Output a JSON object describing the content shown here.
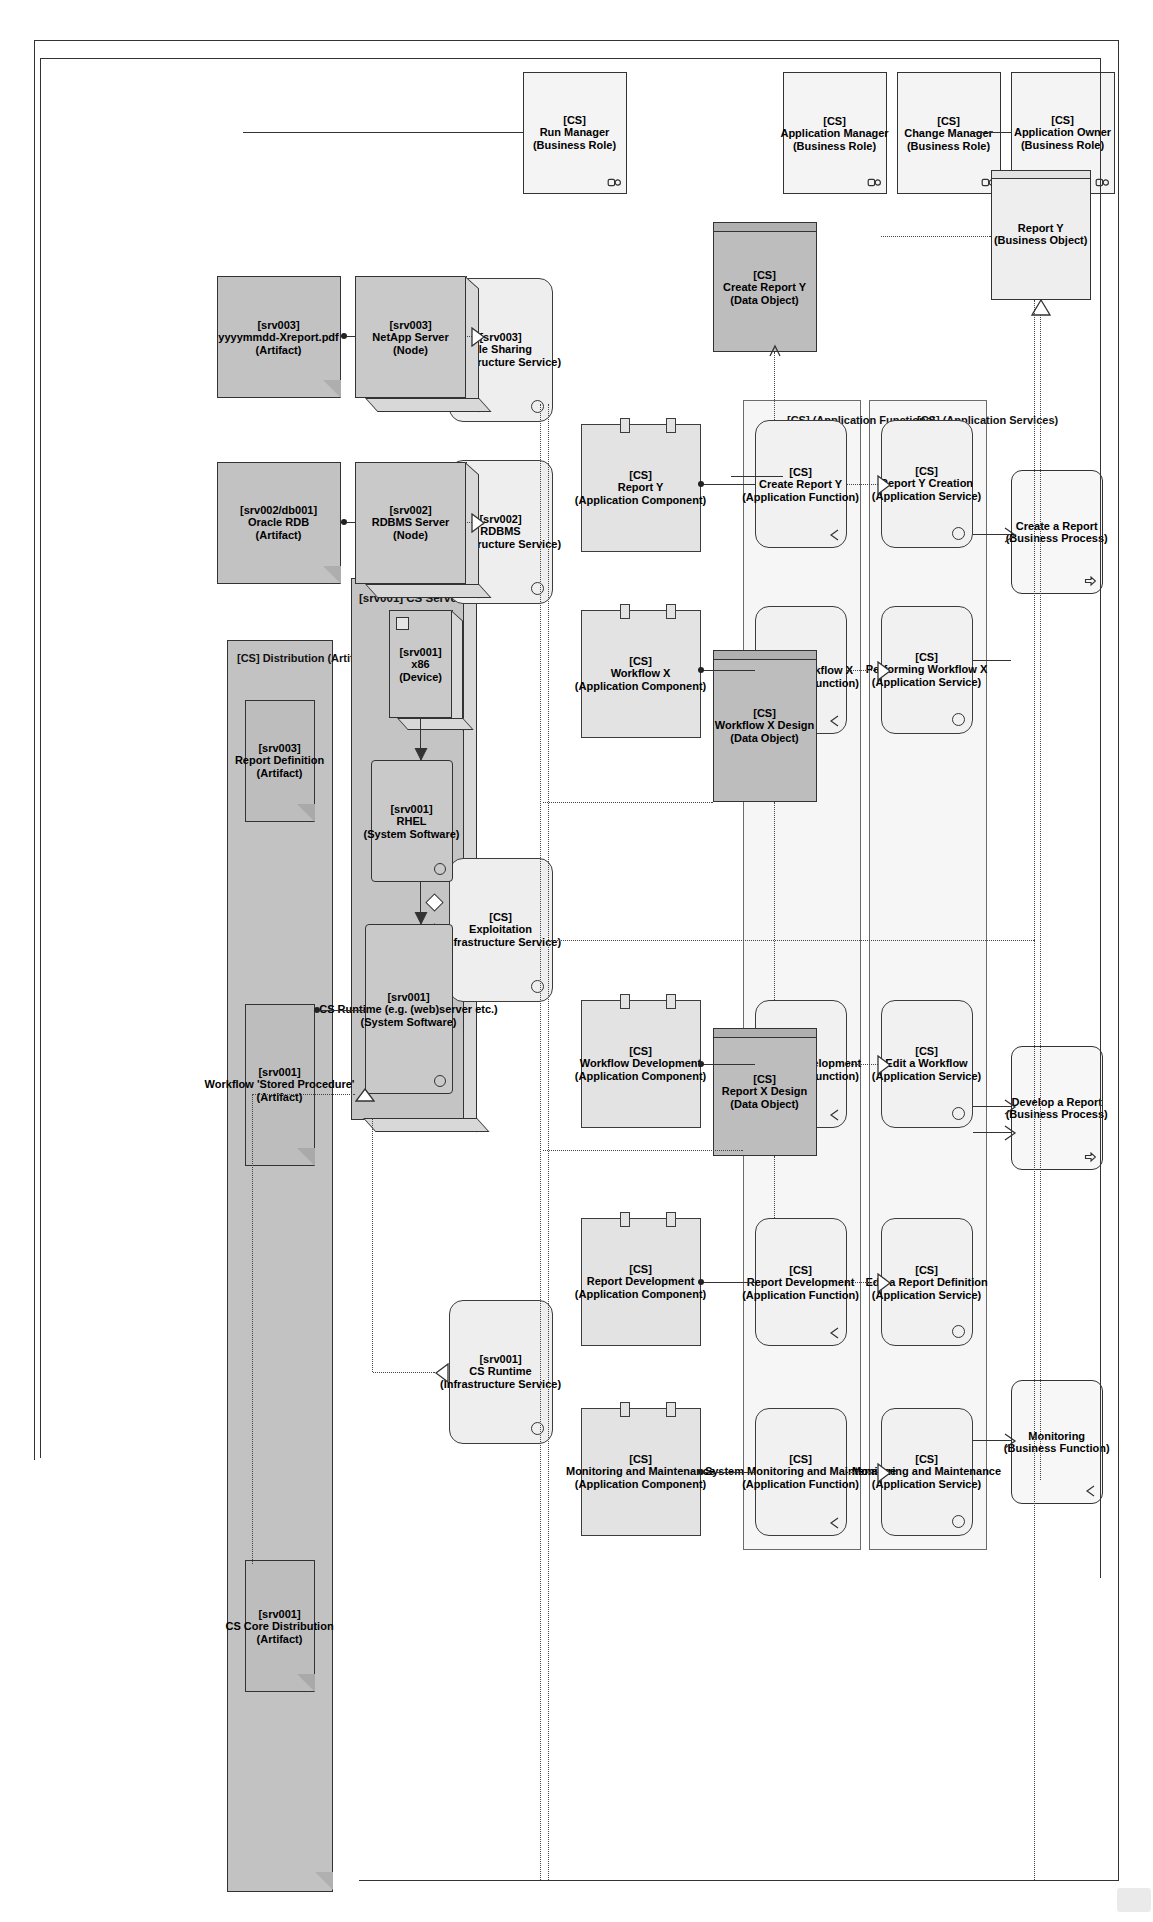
{
  "diagram": {
    "orientation": "landscape-rotated-90"
  },
  "groups": [
    {
      "id": "g_appsvc",
      "label": "[CS] (Application Services)"
    },
    {
      "id": "g_appfunc",
      "label": "[CS] (Application Functions)"
    },
    {
      "id": "g_dist",
      "label": "[CS] Distribution (Artifact)"
    },
    {
      "id": "g_csserver",
      "label": "[srv001] CS Server (Node)"
    }
  ],
  "business": {
    "roles": [
      {
        "id": "app_owner",
        "tag": "[CS]",
        "name": "Application Owner",
        "type": "(Business Role)",
        "icon": "actor-icon"
      },
      {
        "id": "chg_manager",
        "tag": "[CS]",
        "name": "Change Manager",
        "type": "(Business Role)",
        "icon": "actor-icon"
      },
      {
        "id": "app_manager",
        "tag": "[CS]",
        "name": "Application Manager",
        "type": "(Business Role)",
        "icon": "actor-icon"
      },
      {
        "id": "run_manager",
        "tag": "[CS]",
        "name": "Run Manager",
        "type": "(Business Role)",
        "icon": "actor-icon"
      }
    ],
    "objects": [
      {
        "id": "report_y_bo",
        "tag": "",
        "name": "Report Y",
        "type": "(Business Object)"
      }
    ],
    "processes": [
      {
        "id": "create_report",
        "tag": "",
        "name": "Create a Report",
        "type": "(Business Process)",
        "icon": "arrow-up-icon"
      },
      {
        "id": "develop_report",
        "tag": "",
        "name": "Develop a Report",
        "type": "(Business Process)",
        "icon": "arrow-up-icon"
      }
    ],
    "functions": [
      {
        "id": "monitoring_bf",
        "tag": "",
        "name": "Monitoring",
        "type": "(Business Function)",
        "icon": "function-icon"
      }
    ]
  },
  "application": {
    "services": [
      {
        "id": "svc_rpty_creation",
        "tag": "[CS]",
        "name": "Report Y Creation",
        "type": "(Application Service)"
      },
      {
        "id": "svc_perf_wfx",
        "tag": "[CS]",
        "name": "Performing Workflow X",
        "type": "(Application Service)"
      },
      {
        "id": "svc_edit_wf",
        "tag": "[CS]",
        "name": "Edit a Workflow",
        "type": "(Application Service)"
      },
      {
        "id": "svc_edit_rpt_def",
        "tag": "[CS]",
        "name": "Edit a Report Definition",
        "type": "(Application Service)"
      },
      {
        "id": "svc_mon_maint",
        "tag": "[CS]",
        "name": "Monitoring and Maintenance",
        "type": "(Application Service)"
      }
    ],
    "functions": [
      {
        "id": "fn_create_rpty",
        "tag": "[CS]",
        "name": "Create Report Y",
        "type": "(Application Function)"
      },
      {
        "id": "fn_perf_wfx",
        "tag": "[CS]",
        "name": "Perform Workflow X",
        "type": "(Application Function)"
      },
      {
        "id": "fn_wf_dev",
        "tag": "[CS]",
        "name": "Workflow Development",
        "type": "(Application Function)"
      },
      {
        "id": "fn_rpt_dev",
        "tag": "[CS]",
        "name": "Report Development",
        "type": "(Application Function)"
      },
      {
        "id": "fn_sys_mon",
        "tag": "[CS]",
        "name": "System Monitoring and Maintenance",
        "type": "(Application Function)"
      }
    ],
    "components": [
      {
        "id": "cmp_report_y",
        "tag": "[CS]",
        "name": "Report Y",
        "type": "(Application Component)"
      },
      {
        "id": "cmp_wf_x",
        "tag": "[CS]",
        "name": "Workflow X",
        "type": "(Application Component)"
      },
      {
        "id": "cmp_wf_dev",
        "tag": "[CS]",
        "name": "Workflow Development",
        "type": "(Application Component)"
      },
      {
        "id": "cmp_rpt_dev",
        "tag": "[CS]",
        "name": "Report Development",
        "type": "(Application Component)"
      },
      {
        "id": "cmp_mon_mnt",
        "tag": "[CS]",
        "name": "Monitoring and Maintenance",
        "type": "(Application Component)"
      }
    ],
    "data_objects": [
      {
        "id": "do_create_rpty",
        "tag": "[CS]",
        "name": "Create Report Y",
        "type": "(Data Object)"
      },
      {
        "id": "do_wfx_design",
        "tag": "[CS]",
        "name": "Workflow X Design",
        "type": "(Data Object)"
      },
      {
        "id": "do_rptx_design",
        "tag": "[CS]",
        "name": "Report X Design",
        "type": "(Data Object)"
      }
    ]
  },
  "technology": {
    "infrastructure_services": [
      {
        "id": "is_file_sharing",
        "tag": "[srv003]",
        "name": "File Sharing",
        "type": "(Infrastructure Service)"
      },
      {
        "id": "is_rdbms",
        "tag": "[srv002]",
        "name": "RDBMS",
        "type": "(Infrastructure Service)"
      },
      {
        "id": "is_exploitation",
        "tag": "[CS]",
        "name": "Exploitation",
        "type": "(Infrastructure Service)"
      },
      {
        "id": "is_cs_runtime",
        "tag": "[srv001]",
        "name": "CS Runtime",
        "type": "(Infrastructure Service)"
      }
    ],
    "nodes": [
      {
        "id": "nd_netapp",
        "tag": "[srv003]",
        "name": "NetApp Server",
        "type": "(Node)"
      },
      {
        "id": "nd_rdbms",
        "tag": "[srv002]",
        "name": "RDBMS Server",
        "type": "(Node)"
      }
    ],
    "devices": [
      {
        "id": "dv_x86",
        "tag": "[srv001]",
        "name": "x86",
        "type": "(Device)"
      }
    ],
    "system_software": [
      {
        "id": "ss_rhel",
        "tag": "[srv001]",
        "name": "RHEL",
        "type": "(System Software)"
      },
      {
        "id": "ss_cs_runtime",
        "tag": "[srv001]",
        "name": "CS Runtime (e.g. (web)server etc.)",
        "type": "(System Software)"
      }
    ],
    "artifacts": [
      {
        "id": "af_xreport",
        "tag": "[srv003]",
        "name": "yyyymmdd-Xreport.pdf",
        "type": "(Artifact)"
      },
      {
        "id": "af_oracle",
        "tag": "[srv002/db001]",
        "name": "Oracle RDB",
        "type": "(Artifact)"
      },
      {
        "id": "af_rpt_def",
        "tag": "[srv003]",
        "name": "Report Definition",
        "type": "(Artifact)"
      },
      {
        "id": "af_wf_sp",
        "tag": "[srv001]",
        "name": "Workflow 'Stored Procedure'",
        "type": "(Artifact)"
      },
      {
        "id": "af_cs_core",
        "tag": "[srv001]",
        "name": "CS Core Distribution",
        "type": "(Artifact)"
      }
    ]
  },
  "colors": {
    "business": "#f4f4f4",
    "application": "#f1f1f1",
    "component": "#e3e3e3",
    "data_object": "#bdbdbd",
    "technology": "#c9c9c9",
    "artifact": "#c2c2c2",
    "line": "#333333"
  }
}
